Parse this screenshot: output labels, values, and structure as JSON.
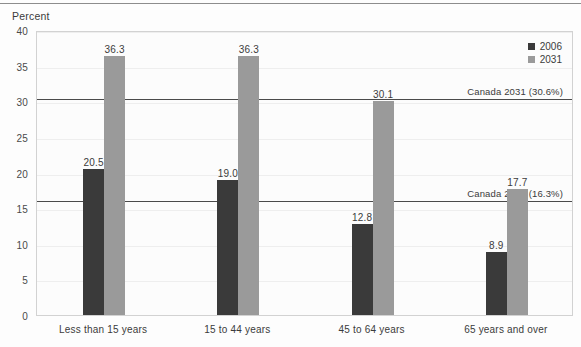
{
  "chart_data": {
    "type": "bar",
    "title": "",
    "ylabel": "Percent",
    "xlabel": "",
    "ylim": [
      0,
      40
    ],
    "yticks": [
      0,
      5,
      10,
      15,
      20,
      25,
      30,
      35,
      40
    ],
    "grid": true,
    "legend_position": "top-right",
    "categories": [
      "Less than 15 years",
      "15 to 44 years",
      "45 to 64 years",
      "65 years and over"
    ],
    "series": [
      {
        "name": "2006",
        "color": "#3a3a3a",
        "values": [
          20.5,
          19.0,
          12.8,
          8.9
        ]
      },
      {
        "name": "2031",
        "color": "#9a9a9a",
        "values": [
          36.3,
          36.3,
          30.1,
          17.7
        ]
      }
    ],
    "value_labels": {
      "2006": [
        "20.5",
        "19.0",
        "12.8",
        "8.9"
      ],
      "2031": [
        "36.3",
        "36.3",
        "30.1",
        "17.7"
      ]
    },
    "reference_lines": [
      {
        "label": "Canada 2031 (30.6%)",
        "value": 30.6,
        "color": "#4a4a4a"
      },
      {
        "label": "Canada 2006 (16.3%)",
        "value": 16.3,
        "color": "#4a4a4a"
      }
    ]
  },
  "legend": {
    "items": [
      {
        "label": "2006"
      },
      {
        "label": "2031"
      }
    ]
  }
}
